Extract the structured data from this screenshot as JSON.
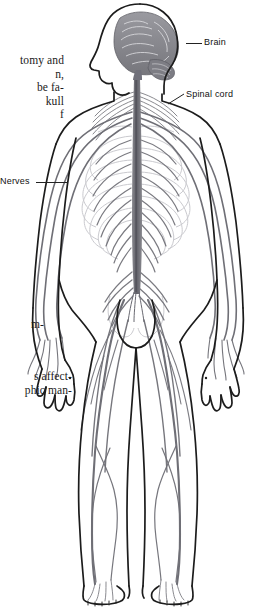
{
  "page": {
    "width": 273,
    "height": 610,
    "background": "#ffffff"
  },
  "body_text": {
    "upper_block": {
      "lines": [
        "tomy and",
        "n,",
        "be fa-",
        "kull",
        "f"
      ]
    },
    "middle_block": {
      "lines": [
        "m-"
      ]
    },
    "lower_block": {
      "lines": [
        "s affect-",
        "phic man-"
      ]
    }
  },
  "figure": {
    "name": "human-nervous-system-diagram",
    "outline_color": "#1c1c1c",
    "nerve_color": "#6e6e74",
    "brain_color": "#8d8d93",
    "skeleton_color": "#c9c9cd",
    "callouts": [
      {
        "id": "brain",
        "label": "Brain",
        "leader": "horizontal line from brain to label",
        "label_x": 204,
        "label_y": 37
      },
      {
        "id": "spinal-cord",
        "label": "Spinal cord",
        "leader": "diagonal line from cervical spinal cord to label",
        "label_x": 186,
        "label_y": 89
      },
      {
        "id": "nerves",
        "label": "Nerves",
        "leader": "horizontal line from label to intercostal nerves",
        "label_x": 0,
        "label_y": 176
      }
    ]
  }
}
